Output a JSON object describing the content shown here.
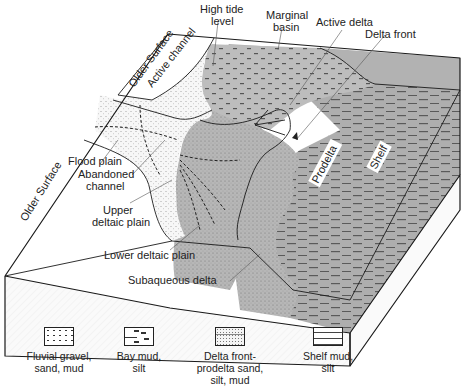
{
  "diagram": {
    "labels": {
      "older_surface_top": "Older Surface",
      "older_surface_left": "Older Surface",
      "active_channel": "Active channel",
      "high_tide_level_1": "High tide",
      "high_tide_level_2": "level",
      "marginal_basin_1": "Marginal",
      "marginal_basin_2": "basin",
      "active_delta": "Active delta",
      "delta_front": "Delta front",
      "flood_plain": "Flood plain",
      "abandoned_channel_1": "Abandoned",
      "abandoned_channel_2": "channel",
      "upper_deltaic_plain_1": "Upper",
      "upper_deltaic_plain_2": "deltaic plain",
      "prodelta": "Prodelta",
      "shelf": "Shelf",
      "lower_deltaic_plain": "Lower deltaic plain",
      "subaqueous_delta": "Subaqueous delta"
    },
    "colors": {
      "land_white": "#ffffff",
      "fluvial_fill": "#f3f3f3",
      "delta_gray": "#b9b9b9",
      "shelf_gray": "#a9a9a9",
      "outline": "#1a1a1a"
    }
  },
  "legend": {
    "items": [
      {
        "pattern": "fluvial",
        "line1": "Fluvial gravel,",
        "line2": "sand,  mud",
        "line3": ""
      },
      {
        "pattern": "bay",
        "line1": "Bay mud,",
        "line2": "silt",
        "line3": ""
      },
      {
        "pattern": "delta",
        "line1": "Delta front-",
        "line2": "prodelta sand,",
        "line3": "silt, mud"
      },
      {
        "pattern": "shelf",
        "line1": "Shelf mud,",
        "line2": "silt",
        "line3": ""
      }
    ]
  }
}
